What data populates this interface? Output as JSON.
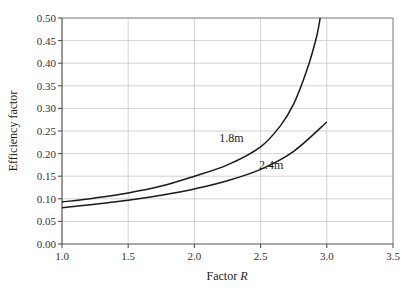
{
  "chart_data": {
    "type": "line",
    "title": "",
    "xlabel": "Factor R",
    "xlabel_text": "Factor ",
    "xlabel_italic": "R",
    "ylabel": "Efficiency factor",
    "xlim": [
      1.0,
      3.5
    ],
    "ylim": [
      0.0,
      0.5
    ],
    "grid": true,
    "legend": "inline labels on curves",
    "x_ticks": [
      "1.0",
      "1.5",
      "2.0",
      "2.5",
      "3.0",
      "3.5"
    ],
    "y_ticks": [
      "0.00",
      "0.05",
      "0.10",
      "0.15",
      "0.20",
      "0.25",
      "0.30",
      "0.35",
      "0.40",
      "0.45",
      "0.50"
    ],
    "series": [
      {
        "name": "1.8m",
        "label_pos": [
          2.28,
          0.225
        ],
        "x": [
          1.0,
          1.25,
          1.5,
          1.75,
          2.0,
          2.25,
          2.5,
          2.65,
          2.75,
          2.85,
          2.92,
          2.95
        ],
        "values": [
          0.093,
          0.102,
          0.113,
          0.128,
          0.15,
          0.175,
          0.215,
          0.262,
          0.31,
          0.385,
          0.455,
          0.5
        ]
      },
      {
        "name": "2.4m",
        "label_pos": [
          2.58,
          0.165
        ],
        "x": [
          1.0,
          1.25,
          1.5,
          1.75,
          2.0,
          2.25,
          2.5,
          2.75,
          3.0
        ],
        "values": [
          0.08,
          0.088,
          0.097,
          0.108,
          0.122,
          0.14,
          0.165,
          0.205,
          0.27
        ]
      }
    ]
  }
}
